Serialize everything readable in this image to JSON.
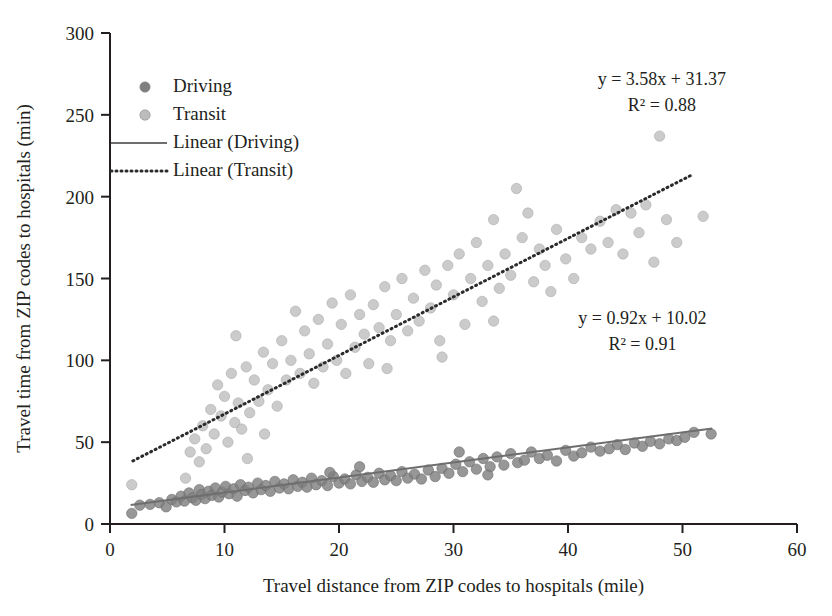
{
  "chart_data": {
    "type": "scatter",
    "title": "",
    "xlabel": "Travel distance from ZIP codes to hospitals (mile)",
    "ylabel": "Travel time from ZIP codes to hospitals (min)",
    "xlim": [
      0,
      60
    ],
    "ylim": [
      0,
      300
    ],
    "xticks": [
      "0",
      "10",
      "20",
      "30",
      "40",
      "50",
      "60"
    ],
    "xtick_values": [
      0,
      10,
      20,
      30,
      40,
      50,
      60
    ],
    "yticks": [
      "0",
      "50",
      "100",
      "150",
      "200",
      "250",
      "300"
    ],
    "ytick_values": [
      0,
      50,
      100,
      150,
      200,
      250,
      300
    ],
    "grid": false,
    "legend_position": "top-left inside plot",
    "legend": [
      {
        "label": "Driving",
        "marker": "circle",
        "color": "#808080"
      },
      {
        "label": "Transit",
        "marker": "circle",
        "color": "#bcbcbc"
      },
      {
        "label": "Linear (Driving)",
        "marker": "solid-line",
        "color": "#6e6e6e"
      },
      {
        "label": "Linear (Transit)",
        "marker": "dotted-line",
        "color": "#2b2b2b"
      }
    ],
    "annotations": [
      {
        "name": "transit-equation",
        "lines": [
          "y = 3.58x + 31.37",
          "R² = 0.88"
        ],
        "x": 48.2,
        "y": 268
      },
      {
        "name": "driving-equation",
        "lines": [
          "y = 0.92x + 10.02",
          "R² = 0.91"
        ],
        "x": 46.5,
        "y": 122
      }
    ],
    "series": [
      {
        "name": "Driving",
        "color": "#808080",
        "marker": "circle",
        "trendline": {
          "name": "Linear (Driving)",
          "style": "solid",
          "color": "#6e6e6e",
          "equation": "y = 0.92x + 10.02",
          "r_squared": 0.91,
          "slope": 0.92,
          "intercept": 10.02,
          "x_start": 1.8,
          "x_end": 52.6
        },
        "points": [
          [
            1.9,
            6.5
          ],
          [
            2.6,
            11.5
          ],
          [
            3.5,
            12.0
          ],
          [
            4.3,
            13.0
          ],
          [
            4.9,
            10.5
          ],
          [
            5.4,
            15.0
          ],
          [
            5.8,
            13.5
          ],
          [
            6.2,
            17.0
          ],
          [
            6.5,
            14.0
          ],
          [
            6.9,
            19.0
          ],
          [
            7.2,
            16.0
          ],
          [
            7.5,
            14.5
          ],
          [
            7.8,
            21.0
          ],
          [
            8.0,
            18.0
          ],
          [
            8.3,
            15.5
          ],
          [
            8.6,
            20.0
          ],
          [
            8.9,
            17.5
          ],
          [
            9.2,
            22.0
          ],
          [
            9.5,
            16.5
          ],
          [
            9.8,
            19.5
          ],
          [
            10.1,
            23.0
          ],
          [
            10.4,
            18.5
          ],
          [
            10.8,
            21.5
          ],
          [
            11.1,
            17.0
          ],
          [
            11.4,
            24.0
          ],
          [
            11.8,
            20.5
          ],
          [
            12.1,
            22.5
          ],
          [
            12.5,
            19.0
          ],
          [
            12.9,
            25.0
          ],
          [
            13.2,
            21.0
          ],
          [
            13.6,
            23.5
          ],
          [
            14.0,
            20.0
          ],
          [
            14.4,
            26.0
          ],
          [
            14.8,
            22.0
          ],
          [
            15.2,
            24.5
          ],
          [
            15.6,
            21.5
          ],
          [
            16.0,
            27.0
          ],
          [
            16.4,
            23.0
          ],
          [
            16.8,
            25.5
          ],
          [
            17.2,
            22.5
          ],
          [
            17.6,
            28.0
          ],
          [
            18.0,
            24.0
          ],
          [
            18.5,
            26.5
          ],
          [
            19.0,
            23.5
          ],
          [
            19.5,
            29.0
          ],
          [
            20.0,
            25.0
          ],
          [
            20.5,
            27.5
          ],
          [
            21.0,
            24.5
          ],
          [
            21.5,
            30.0
          ],
          [
            22.0,
            26.0
          ],
          [
            22.5,
            28.5
          ],
          [
            23.0,
            25.5
          ],
          [
            23.5,
            31.0
          ],
          [
            24.0,
            27.0
          ],
          [
            24.5,
            29.5
          ],
          [
            25.0,
            26.5
          ],
          [
            25.5,
            32.0
          ],
          [
            26.0,
            28.0
          ],
          [
            26.6,
            30.5
          ],
          [
            27.2,
            27.5
          ],
          [
            27.8,
            33.0
          ],
          [
            28.4,
            29.0
          ],
          [
            29.0,
            34.0
          ],
          [
            29.6,
            31.0
          ],
          [
            30.2,
            36.5
          ],
          [
            30.8,
            32.0
          ],
          [
            31.4,
            38.0
          ],
          [
            32.0,
            33.5
          ],
          [
            32.6,
            40.0
          ],
          [
            33.2,
            35.0
          ],
          [
            33.8,
            41.0
          ],
          [
            34.4,
            36.0
          ],
          [
            35.0,
            43.0
          ],
          [
            35.6,
            37.5
          ],
          [
            36.2,
            39.0
          ],
          [
            36.8,
            44.0
          ],
          [
            37.5,
            40.0
          ],
          [
            38.2,
            42.0
          ],
          [
            39.0,
            38.5
          ],
          [
            39.8,
            45.0
          ],
          [
            40.5,
            41.5
          ],
          [
            41.2,
            43.5
          ],
          [
            42.0,
            47.0
          ],
          [
            42.8,
            44.5
          ],
          [
            43.6,
            46.0
          ],
          [
            44.3,
            48.5
          ],
          [
            45.0,
            45.5
          ],
          [
            45.8,
            49.5
          ],
          [
            46.5,
            47.5
          ],
          [
            47.2,
            50.5
          ],
          [
            48.0,
            49.0
          ],
          [
            48.8,
            52.0
          ],
          [
            49.5,
            51.0
          ],
          [
            50.2,
            53.0
          ],
          [
            51.0,
            56.0
          ],
          [
            52.5,
            55.0
          ],
          [
            30.5,
            44.0
          ],
          [
            33.0,
            30.0
          ],
          [
            21.8,
            35.0
          ],
          [
            19.2,
            31.5
          ]
        ]
      },
      {
        "name": "Transit",
        "color": "#bcbcbc",
        "marker": "circle",
        "trendline": {
          "name": "Linear (Transit)",
          "style": "dotted",
          "color": "#2b2b2b",
          "equation": "y = 3.58x + 31.37",
          "r_squared": 0.88,
          "slope": 3.58,
          "intercept": 31.37,
          "x_start": 2.0,
          "x_end": 50.8
        },
        "points": [
          [
            1.9,
            24.0
          ],
          [
            6.6,
            28.0
          ],
          [
            7.0,
            44.0
          ],
          [
            7.4,
            52.0
          ],
          [
            7.8,
            38.0
          ],
          [
            8.1,
            60.0
          ],
          [
            8.4,
            46.0
          ],
          [
            8.8,
            70.0
          ],
          [
            9.1,
            55.0
          ],
          [
            9.4,
            85.0
          ],
          [
            9.7,
            66.0
          ],
          [
            10.0,
            78.0
          ],
          [
            10.3,
            50.0
          ],
          [
            10.6,
            92.0
          ],
          [
            10.9,
            62.0
          ],
          [
            11.2,
            74.0
          ],
          [
            11.5,
            58.0
          ],
          [
            11.9,
            96.0
          ],
          [
            12.2,
            68.0
          ],
          [
            12.6,
            88.0
          ],
          [
            13.0,
            75.0
          ],
          [
            13.4,
            105.0
          ],
          [
            13.8,
            82.0
          ],
          [
            14.2,
            98.0
          ],
          [
            14.6,
            72.0
          ],
          [
            15.0,
            112.0
          ],
          [
            15.4,
            88.0
          ],
          [
            15.8,
            100.0
          ],
          [
            16.2,
            130.0
          ],
          [
            16.6,
            92.0
          ],
          [
            17.0,
            118.0
          ],
          [
            17.4,
            104.0
          ],
          [
            17.8,
            86.0
          ],
          [
            18.2,
            125.0
          ],
          [
            18.6,
            96.0
          ],
          [
            19.0,
            110.0
          ],
          [
            19.4,
            135.0
          ],
          [
            19.8,
            100.0
          ],
          [
            20.2,
            122.0
          ],
          [
            20.6,
            92.0
          ],
          [
            21.0,
            140.0
          ],
          [
            21.4,
            108.0
          ],
          [
            21.8,
            128.0
          ],
          [
            22.2,
            116.0
          ],
          [
            22.6,
            98.0
          ],
          [
            23.0,
            134.0
          ],
          [
            23.5,
            120.0
          ],
          [
            24.0,
            145.0
          ],
          [
            24.5,
            112.0
          ],
          [
            25.0,
            128.0
          ],
          [
            25.5,
            150.0
          ],
          [
            26.0,
            118.0
          ],
          [
            26.5,
            138.0
          ],
          [
            27.0,
            124.0
          ],
          [
            27.5,
            155.0
          ],
          [
            28.0,
            132.0
          ],
          [
            28.5,
            146.0
          ],
          [
            29.0,
            102.0
          ],
          [
            29.5,
            158.0
          ],
          [
            30.0,
            140.0
          ],
          [
            30.5,
            165.0
          ],
          [
            31.0,
            122.0
          ],
          [
            31.5,
            150.0
          ],
          [
            32.0,
            172.0
          ],
          [
            32.5,
            136.0
          ],
          [
            33.0,
            158.0
          ],
          [
            33.5,
            186.0
          ],
          [
            34.0,
            144.0
          ],
          [
            34.5,
            165.0
          ],
          [
            35.0,
            152.0
          ],
          [
            35.5,
            205.0
          ],
          [
            36.0,
            175.0
          ],
          [
            36.5,
            190.0
          ],
          [
            37.0,
            148.0
          ],
          [
            37.5,
            168.0
          ],
          [
            38.0,
            158.0
          ],
          [
            38.5,
            142.0
          ],
          [
            39.0,
            180.0
          ],
          [
            39.8,
            162.0
          ],
          [
            40.5,
            150.0
          ],
          [
            41.2,
            175.0
          ],
          [
            42.0,
            168.0
          ],
          [
            42.8,
            185.0
          ],
          [
            43.5,
            172.0
          ],
          [
            44.2,
            192.0
          ],
          [
            44.8,
            165.0
          ],
          [
            45.5,
            190.0
          ],
          [
            46.2,
            178.0
          ],
          [
            46.8,
            195.0
          ],
          [
            47.5,
            160.0
          ],
          [
            48.0,
            237.0
          ],
          [
            48.6,
            186.0
          ],
          [
            49.5,
            172.0
          ],
          [
            51.8,
            188.0
          ],
          [
            12.0,
            40.0
          ],
          [
            13.5,
            55.0
          ],
          [
            11.0,
            115.0
          ],
          [
            24.2,
            95.0
          ],
          [
            28.8,
            112.0
          ],
          [
            33.5,
            124.0
          ]
        ]
      }
    ]
  }
}
